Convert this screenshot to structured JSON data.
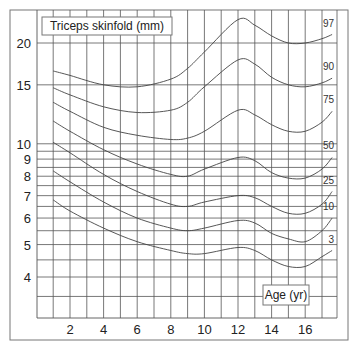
{
  "chart_data": {
    "type": "line",
    "title": "Triceps skinfold (mm)",
    "xlabel": "Age (yr)",
    "ylabel": "Triceps skinfold (mm)",
    "yscale": "log",
    "xlim": [
      0,
      18
    ],
    "ylim": [
      3.2,
      24
    ],
    "grid": true,
    "legend_position": "inline-right",
    "x_ticks": [
      2,
      4,
      6,
      8,
      10,
      12,
      14,
      16
    ],
    "x_tick_labels": [
      "2",
      "4",
      "6",
      "8",
      "10",
      "12",
      "14",
      "16"
    ],
    "y_ticks": [
      4,
      5,
      6,
      7,
      8,
      9,
      10,
      15,
      20
    ],
    "y_tick_labels": [
      "4",
      "5",
      "6",
      "7",
      "8",
      "9",
      "10",
      "15",
      "20"
    ],
    "x": [
      1,
      2,
      4,
      6,
      8,
      9,
      10,
      12,
      13,
      14,
      15,
      16,
      17,
      17.6
    ],
    "series": [
      {
        "name": "97",
        "values": [
          16.5,
          16.0,
          15.0,
          14.8,
          15.6,
          16.8,
          18.8,
          23.5,
          22.6,
          21.0,
          20.0,
          20.0,
          20.6,
          21.2
        ]
      },
      {
        "name": "90",
        "values": [
          14.7,
          14.0,
          12.9,
          12.4,
          12.6,
          13.3,
          14.8,
          17.8,
          17.3,
          15.8,
          15.0,
          14.8,
          15.2,
          15.7
        ]
      },
      {
        "name": "75",
        "values": [
          13.3,
          12.5,
          11.2,
          10.6,
          10.3,
          10.4,
          10.9,
          12.6,
          12.2,
          11.4,
          10.9,
          10.9,
          11.6,
          12.5
        ]
      },
      {
        "name": "50",
        "values": [
          11.7,
          10.9,
          9.6,
          8.7,
          8.1,
          8.0,
          8.4,
          9.1,
          8.9,
          8.2,
          7.9,
          7.9,
          8.4,
          9.1
        ]
      },
      {
        "name": "25",
        "values": [
          10.1,
          9.4,
          8.1,
          7.2,
          6.6,
          6.5,
          6.7,
          7.0,
          6.9,
          6.5,
          6.2,
          6.2,
          6.6,
          7.2
        ]
      },
      {
        "name": "10",
        "values": [
          8.3,
          7.7,
          6.7,
          6.0,
          5.6,
          5.5,
          5.6,
          5.9,
          5.8,
          5.4,
          5.2,
          5.1,
          5.5,
          6.0
        ]
      },
      {
        "name": "3",
        "values": [
          6.8,
          6.3,
          5.6,
          5.1,
          4.8,
          4.7,
          4.7,
          4.9,
          4.8,
          4.5,
          4.3,
          4.3,
          4.6,
          4.8
        ]
      }
    ]
  },
  "labels": {
    "title_box": "Triceps skinfold (mm)",
    "xlabel_box": "Age (yr)"
  }
}
